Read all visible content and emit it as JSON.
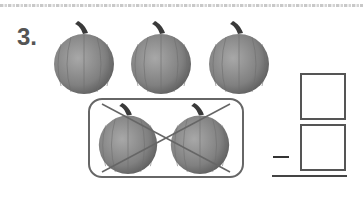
{
  "problem": {
    "number": "3.",
    "operator": "minus",
    "total_pumpkins": 5,
    "crossed_out_pumpkins": 2,
    "answer_boxes": 2
  },
  "colors": {
    "pumpkin": "#8a8a8a",
    "stem": "#3a3a3a",
    "border": "#666666"
  }
}
